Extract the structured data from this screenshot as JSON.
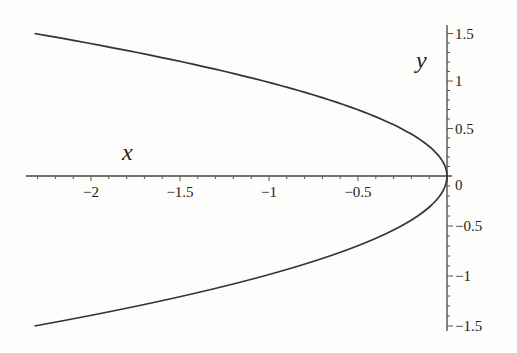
{
  "chart_data": {
    "type": "line",
    "title": "",
    "xlabel": "x",
    "ylabel": "y",
    "xlim": [
      -2.35,
      0.02
    ],
    "ylim": [
      -1.55,
      1.6
    ],
    "x_ticks": [
      -2,
      -1.5,
      -1,
      -0.5,
      0
    ],
    "x_tick_labels": [
      "−2",
      "−1.5",
      "−1",
      "−0.5",
      "0"
    ],
    "y_ticks": [
      1.5,
      1,
      0.5,
      -0.5,
      -1,
      -1.5
    ],
    "y_tick_labels": [
      "1.5",
      "1",
      "0.5",
      "−0.5",
      "−1",
      "−1.5"
    ],
    "grid": false,
    "legend": null,
    "series": [
      {
        "name": "curve x = -y^2 (sideways parabola opening left)",
        "y": [
          -1.5,
          -1.25,
          -1.0,
          -0.75,
          -0.5,
          -0.25,
          0,
          0.25,
          0.5,
          0.75,
          1.0,
          1.25,
          1.5
        ],
        "x": [
          -2.32,
          -1.62,
          -1.05,
          -0.6,
          -0.28,
          -0.07,
          0,
          -0.07,
          -0.28,
          -0.6,
          -1.05,
          -1.62,
          -2.32
        ]
      }
    ],
    "color": "#333333"
  },
  "labels": {
    "x_axis": "x",
    "y_axis": "y",
    "zero": "0"
  }
}
